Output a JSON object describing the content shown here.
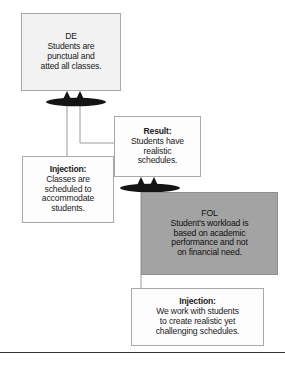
{
  "diagram": {
    "type": "evaporating-cloud-injection-diagram",
    "nodes": [
      {
        "id": "de",
        "label": "DE",
        "title": "DE",
        "lines": [
          "Students are",
          "punctual and",
          "atted all classes."
        ],
        "fill": "#f2f2f2",
        "border": "#a9a9a9"
      },
      {
        "id": "result",
        "label": "Result",
        "title": "Result:",
        "lines": [
          "Students have",
          "realistic",
          "schedules."
        ],
        "fill": "#fdfdfd",
        "border": "#a9a9a9"
      },
      {
        "id": "injection-left",
        "label": "Injection",
        "title": "Injection:",
        "lines": [
          "Classes are",
          "scheduled to",
          "accommodate",
          "students."
        ],
        "fill": "#fdfdfd",
        "border": "#a9a9a9"
      },
      {
        "id": "fol",
        "label": "FOL",
        "title": "FOL",
        "lines": [
          "Student's workload is",
          "based on academic",
          "performance and not",
          "on financial need."
        ],
        "fill": "#a3a3a3",
        "border": "#8e8e8e"
      },
      {
        "id": "injection-bottom",
        "label": "Injection",
        "title": "Injection:",
        "lines": [
          "We work with students",
          "to create realistic yet",
          "challenging schedules."
        ],
        "fill": "#fdfdfd",
        "border": "#a9a9a9"
      }
    ],
    "connectors": {
      "ellipse_color": "#141414",
      "line_color": "#9a9a9a",
      "arrow_color": "#141414",
      "ellipses": [
        {
          "id": "and-junction-top",
          "cx": 76,
          "cy": 102,
          "rx": 30,
          "ry": 4
        },
        {
          "id": "and-junction-bottom",
          "cx": 150,
          "cy": 188,
          "rx": 30,
          "ry": 4
        }
      ],
      "arrows": [
        {
          "id": "arrow-to-de-left",
          "x": 67,
          "y": 93
        },
        {
          "id": "arrow-to-de-right",
          "x": 80,
          "y": 93
        },
        {
          "id": "arrow-to-result-left",
          "x": 141,
          "y": 179
        },
        {
          "id": "arrow-to-result-right",
          "x": 154,
          "y": 179
        }
      ]
    },
    "footer_rule_color": "#333333"
  }
}
